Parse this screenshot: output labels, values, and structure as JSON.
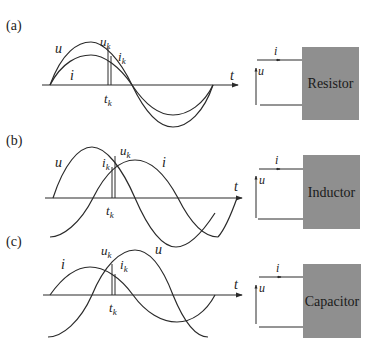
{
  "figure": {
    "panels": [
      {
        "id": "a",
        "label": "(a)",
        "element": "Resistor",
        "curve_u_label": "u",
        "curve_i_label": "i",
        "uk_label": "u",
        "uk_sub": "k",
        "ik_label": "i",
        "ik_sub": "k",
        "tk_label": "t",
        "tk_sub": "k",
        "axis_label": "t",
        "circuit_i_label": "i",
        "circuit_u_label": "u",
        "phase": "in phase"
      },
      {
        "id": "b",
        "label": "(b)",
        "element": "Inductor",
        "curve_u_label": "u",
        "curve_i_label": "i",
        "uk_label": "u",
        "uk_sub": "k",
        "ik_label": "i",
        "ik_sub": "k",
        "tk_label": "t",
        "tk_sub": "k",
        "axis_label": "t",
        "circuit_i_label": "i",
        "circuit_u_label": "u",
        "phase": "voltage leads current by 90°"
      },
      {
        "id": "c",
        "label": "(c)",
        "element": "Capacitor",
        "curve_u_label": "u",
        "curve_i_label": "i",
        "uk_label": "u",
        "uk_sub": "k",
        "ik_label": "i",
        "ik_sub": "k",
        "tk_label": "t",
        "tk_sub": "k",
        "axis_label": "t",
        "circuit_i_label": "i",
        "circuit_u_label": "u",
        "phase": "current leads voltage by 90°"
      }
    ],
    "colors": {
      "line": "#2a2a2a",
      "box_fill": "#8f8f8f",
      "text": "#1a1a1a"
    }
  }
}
